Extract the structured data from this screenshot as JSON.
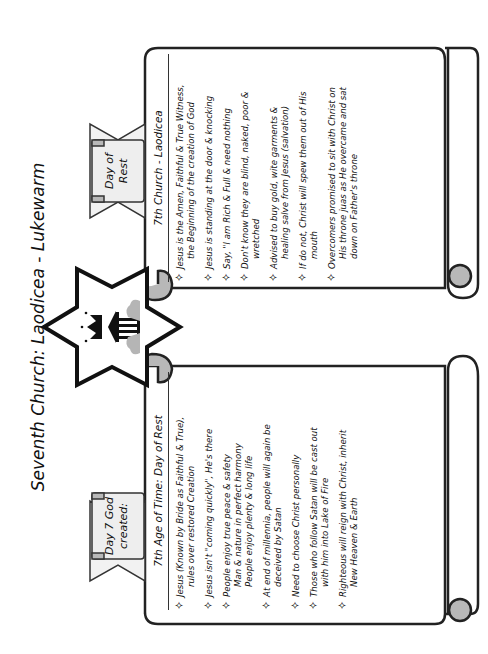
{
  "title": "Seventh Church: Laodicea - Lukewarm",
  "center_emblem": {
    "icon": "star-of-david-with-crown-and-temple-icon"
  },
  "left_scroll": {
    "ribbon_lines": [
      "Day 7 God",
      "created:"
    ],
    "heading": "7th Age of Time: Day of Rest",
    "items": [
      {
        "lines": [
          "Jesus (Known by Bride as Faithful & True),",
          "rules over restored Creation"
        ]
      },
      {
        "lines": [
          "Jesus isn't \"coming quickly\", He's there"
        ]
      },
      {
        "lines": [
          "People enjoy true peace & safety",
          "Man & nature in perfect harmony",
          "People enjoy plenty & long life"
        ]
      },
      {
        "lines": [
          "At end of millennia, people will again be",
          "deceived by Satan"
        ]
      },
      {
        "lines": [
          "Need to choose Christ personally"
        ]
      },
      {
        "lines": [
          "Those who follow Satan will be cast out",
          "with him into Lake of Fire"
        ]
      },
      {
        "lines": [
          "Righteous will reign with Christ, inherit",
          "New Heaven & Earth"
        ]
      }
    ]
  },
  "right_scroll": {
    "ribbon_lines": [
      "Day of",
      "Rest"
    ],
    "heading": "7th Church - Laodicea",
    "items": [
      {
        "lines": [
          "Jesus is  the Amen, Faithful & True Witness,",
          "the Beginning of the creation of God"
        ]
      },
      {
        "lines": [
          "Jesus is standing at the door & knocking"
        ]
      },
      {
        "lines": [
          "Say, \"I am Rich & Full & need nothing"
        ]
      },
      {
        "lines": [
          "Don't know they are blind, naked, poor &",
          "wretched"
        ]
      },
      {
        "lines": [
          "Advised to buy gold, wite garments &",
          "healing salve from Jesus (salvation)"
        ]
      },
      {
        "lines": [
          "If do not, Christ will spew them out of His",
          "mouth"
        ]
      },
      {
        "lines": [
          "Overcomers promised to sit with Christ on",
          "His throne juas as He overcame and sat",
          "down on Father's throne"
        ]
      }
    ]
  },
  "bullet_glyph": "✧",
  "colors": {
    "outline": "#222222",
    "curl_fill": "#b8b8b8",
    "ribbon_fill": "#f2f2f2"
  }
}
